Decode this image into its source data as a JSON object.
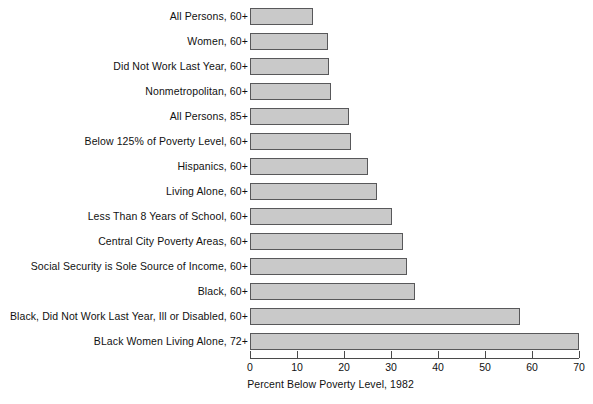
{
  "chart_data": {
    "type": "bar",
    "orientation": "horizontal",
    "title": "",
    "xlabel": "Percent Below Poverty Level, 1982",
    "ylabel": "",
    "xlim": [
      0,
      70
    ],
    "xticks": [
      0,
      10,
      20,
      30,
      40,
      50,
      60,
      70
    ],
    "grid": false,
    "legend": null,
    "bar_color": "#c9c9c9",
    "bar_edge_color": "#58585a",
    "categories": [
      "All Persons, 60+",
      "Women, 60+",
      "Did Not Work Last Year, 60+",
      "Nonmetropolitan, 60+",
      "All Persons, 85+",
      "Below 125% of Poverty Level, 60+",
      "Hispanics, 60+",
      "Living Alone, 60+",
      "Less Than 8 Years of School, 60+",
      "Central City Poverty Areas, 60+",
      "Social Security is Sole Source of Income, 60+",
      "Black, 60+",
      "Black, Did Not Work Last Year, Ill or Disabled, 60+",
      "BLack Women Living Alone, 72+"
    ],
    "values": [
      13.5,
      16.5,
      16.8,
      17.3,
      21,
      21.5,
      25,
      27,
      30.3,
      32.5,
      33.3,
      35,
      57.5,
      70
    ]
  }
}
